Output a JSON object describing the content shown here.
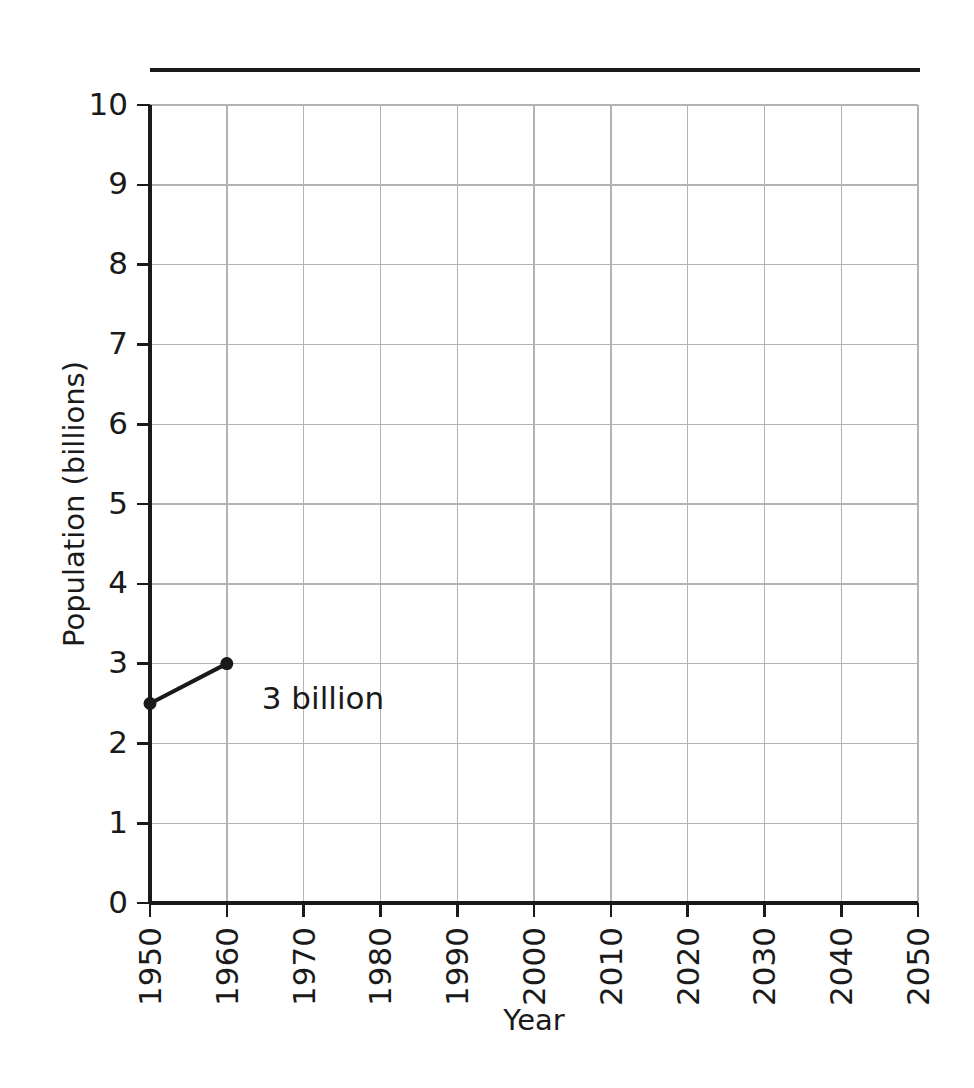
{
  "chart_data": {
    "type": "line",
    "title": "",
    "xlabel": "Year",
    "ylabel": "Population (billions)",
    "xlim": [
      1950,
      2050
    ],
    "ylim": [
      0,
      10
    ],
    "grid": true,
    "legend": "none",
    "x_ticks": [
      "1950",
      "1960",
      "1970",
      "1980",
      "1990",
      "2000",
      "2010",
      "2020",
      "2030",
      "2040",
      "2050"
    ],
    "x_tick_values": [
      1950,
      1960,
      1970,
      1980,
      1990,
      2000,
      2010,
      2020,
      2030,
      2040,
      2050
    ],
    "y_ticks": [
      "0",
      "1",
      "2",
      "3",
      "4",
      "5",
      "6",
      "7",
      "8",
      "9",
      "10"
    ],
    "y_tick_values": [
      0,
      1,
      2,
      3,
      4,
      5,
      6,
      7,
      8,
      9,
      10
    ],
    "series": [
      {
        "name": "World population",
        "x": [
          1950,
          1960
        ],
        "values": [
          2.5,
          3.0
        ]
      }
    ],
    "annotations": [
      {
        "text": "3 billion",
        "x": 1960,
        "y": 2.55
      }
    ],
    "colors": {
      "line": "#1a1a1a",
      "marker": "#1a1a1a",
      "grid": "#b3b3b3",
      "axis": "#1a1a1a",
      "background": "#ffffff"
    }
  },
  "decoration": {
    "top_rule": "horizontal-rule"
  }
}
